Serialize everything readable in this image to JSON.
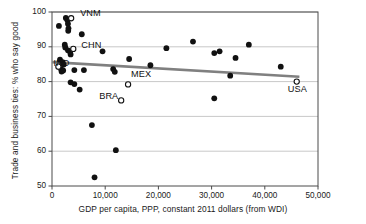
{
  "chart_data": {
    "type": "scatter",
    "title": "",
    "xlabel": "GDP per capita, PPP, constant 2011 dollars (from WDI)",
    "ylabel": "Trade and business ties: % who say good",
    "xlim": [
      0,
      50000
    ],
    "ylim": [
      50,
      100
    ],
    "grid": "horizontal",
    "xticks": [
      "0",
      "10,000",
      "20,000",
      "30,000",
      "40,000",
      "50,000"
    ],
    "xtick_values": [
      0,
      10000,
      20000,
      30000,
      40000,
      50000
    ],
    "yticks": [
      "50",
      "60",
      "70",
      "80",
      "90",
      "100"
    ],
    "ytick_values": [
      50,
      60,
      70,
      80,
      90,
      100
    ],
    "legend": [],
    "series": [
      {
        "name": "countries",
        "marker": "filled-circle",
        "color": "#111111",
        "points": [
          {
            "x": 1300,
            "y": 96.0
          },
          {
            "x": 2600,
            "y": 98.3
          },
          {
            "x": 2900,
            "y": 97.6
          },
          {
            "x": 3000,
            "y": 96.6
          },
          {
            "x": 3100,
            "y": 95.3
          },
          {
            "x": 3050,
            "y": 94.6
          },
          {
            "x": 5600,
            "y": 93.6
          },
          {
            "x": 2400,
            "y": 90.6
          },
          {
            "x": 2500,
            "y": 89.8
          },
          {
            "x": 3000,
            "y": 89.0
          },
          {
            "x": 3400,
            "y": 88.6
          },
          {
            "x": 3500,
            "y": 87.8
          },
          {
            "x": 9500,
            "y": 88.7
          },
          {
            "x": 1500,
            "y": 86.3
          },
          {
            "x": 2000,
            "y": 85.6
          },
          {
            "x": 2200,
            "y": 84.9
          },
          {
            "x": 1700,
            "y": 83.6
          },
          {
            "x": 1800,
            "y": 82.9
          },
          {
            "x": 2100,
            "y": 83.2
          },
          {
            "x": 4200,
            "y": 83.3
          },
          {
            "x": 6000,
            "y": 83.3
          },
          {
            "x": 11500,
            "y": 83.6
          },
          {
            "x": 11800,
            "y": 82.8
          },
          {
            "x": 14500,
            "y": 86.5
          },
          {
            "x": 18500,
            "y": 84.7
          },
          {
            "x": 21500,
            "y": 89.6
          },
          {
            "x": 26500,
            "y": 91.5
          },
          {
            "x": 30500,
            "y": 88.2
          },
          {
            "x": 31500,
            "y": 88.7
          },
          {
            "x": 34500,
            "y": 86.8
          },
          {
            "x": 37000,
            "y": 90.6
          },
          {
            "x": 33500,
            "y": 81.7
          },
          {
            "x": 43000,
            "y": 84.3
          },
          {
            "x": 3500,
            "y": 79.8
          },
          {
            "x": 4200,
            "y": 79.3
          },
          {
            "x": 5200,
            "y": 77.7
          },
          {
            "x": 30500,
            "y": 75.2
          },
          {
            "x": 7500,
            "y": 67.5
          },
          {
            "x": 12000,
            "y": 60.3
          },
          {
            "x": 8000,
            "y": 52.5
          }
        ]
      },
      {
        "name": "labeled-countries",
        "marker": "open-circle",
        "color": "#111111",
        "points": [
          {
            "x": 3600,
            "y": 98.2,
            "label": "VNM"
          },
          {
            "x": 4000,
            "y": 89.4,
            "label": "CHN"
          },
          {
            "x": 1200,
            "y": 84.3,
            "label": "IND"
          },
          {
            "x": 14300,
            "y": 79.2,
            "label": "MEX"
          },
          {
            "x": 13000,
            "y": 74.6,
            "label": "BRA"
          },
          {
            "x": 46000,
            "y": 80.0,
            "label": "USA"
          }
        ]
      }
    ],
    "trendline": {
      "color": "#808080",
      "x0": 0,
      "y0": 85.6,
      "x1": 46500,
      "y1": 81.4
    }
  }
}
